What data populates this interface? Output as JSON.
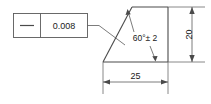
{
  "drawing": {
    "title": "Straightness tolerance on angled surface",
    "feature_control_frame": {
      "symbol_name": "straightness-symbol",
      "symbol_glyph": "—",
      "tolerance_value": "0.008"
    },
    "dimensions": [
      {
        "name": "horizontal-width",
        "value": "25",
        "orientation": "horizontal",
        "position": "bottom"
      },
      {
        "name": "vertical-height",
        "value": "20",
        "orientation": "vertical",
        "position": "right"
      }
    ],
    "angle_annotation": {
      "name": "angle-callout",
      "value": "60°± 2",
      "degrees": 60,
      "plus_minus": 2
    },
    "colors": {
      "part_outline": "#4a4a4a",
      "dimension_line": "#5a5a5a",
      "extension_line": "#6b6b6b",
      "text": "#1a1a1a",
      "background": "#ffffff"
    },
    "shape": {
      "type": "trapezoid",
      "vertices_label": "apex-top-left, top-right, bottom-right, bottom-left"
    }
  }
}
